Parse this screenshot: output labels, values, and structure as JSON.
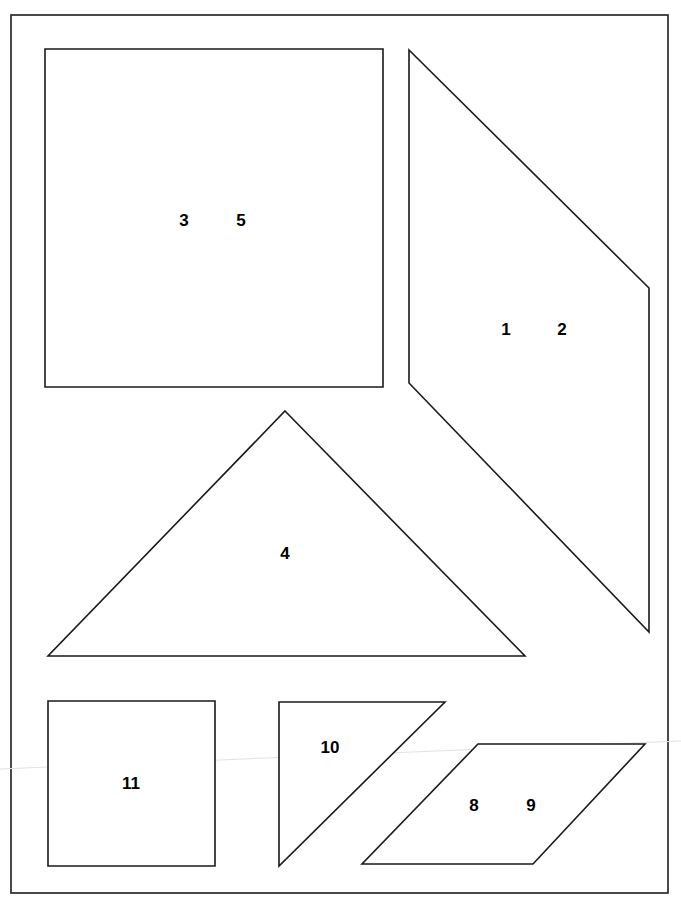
{
  "diagram": {
    "background_color": "#ffffff",
    "outline_color": "#1a1a1a",
    "frame": {
      "name": "page-border",
      "x": 11,
      "y": 15,
      "width": 657,
      "height": 878
    },
    "artifact": {
      "name": "scan-line",
      "color": "#e2e2e2",
      "from": [
        0,
        769
      ],
      "to": [
        681,
        741
      ]
    },
    "shapes": [
      {
        "id": "shape-rectangle-35",
        "kind": "rectangle",
        "points": "45,49 383,49 383,387 45,387",
        "labels": [
          {
            "text": "3",
            "x": 184,
            "y": 220
          },
          {
            "text": "5",
            "x": 241,
            "y": 220
          }
        ]
      },
      {
        "id": "shape-quadrilateral-12",
        "kind": "quadrilateral",
        "points": "409,50 649,288 649,632 409,383",
        "labels": [
          {
            "text": "1",
            "x": 506,
            "y": 329
          },
          {
            "text": "2",
            "x": 562,
            "y": 329
          }
        ]
      },
      {
        "id": "shape-triangle-4",
        "kind": "triangle",
        "points": "285,411 525,656 48,656",
        "labels": [
          {
            "text": "4",
            "x": 285,
            "y": 553
          }
        ]
      },
      {
        "id": "shape-square-11",
        "kind": "square",
        "points": "48,701 215,701 215,866 48,866",
        "labels": [
          {
            "text": "11",
            "x": 131,
            "y": 783
          }
        ]
      },
      {
        "id": "shape-triangle-10",
        "kind": "right-triangle",
        "points": "279,702 445,702 279,866",
        "labels": [
          {
            "text": "10",
            "x": 330,
            "y": 747
          }
        ]
      },
      {
        "id": "shape-parallelogram-89",
        "kind": "parallelogram",
        "points": "478,744 645,744 533,864 362,864",
        "labels": [
          {
            "text": "8",
            "x": 474,
            "y": 805
          },
          {
            "text": "9",
            "x": 531,
            "y": 805
          }
        ]
      }
    ]
  },
  "chart_data": {
    "type": "diagram",
    "shape_count": 6,
    "label_values": [
      "3",
      "5",
      "1",
      "2",
      "4",
      "11",
      "10",
      "8",
      "9"
    ],
    "shape_types": [
      "rectangle",
      "quadrilateral",
      "triangle",
      "square",
      "right-triangle",
      "parallelogram"
    ]
  }
}
